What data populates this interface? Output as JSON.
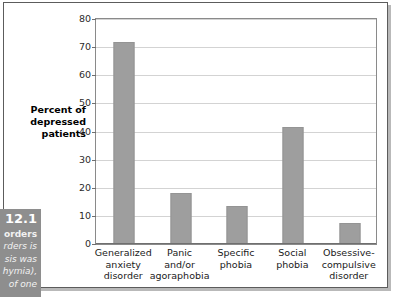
{
  "figure": {
    "caption_number": "12.1",
    "caption_lines": [
      "orders",
      "rders is",
      "sis was",
      "hymia),",
      "of one"
    ]
  },
  "colors": {
    "bar_fill": "#9e9e9e",
    "bar_stroke": "#949494",
    "gridline": "#d3d3d3",
    "plot_border": "#8a8a8a",
    "outer_frame": "#5c5c5c",
    "caption_background": "#8e8e8e",
    "plot_background": "#ffffff"
  },
  "chart_data": {
    "type": "bar",
    "title": "",
    "xlabel": "",
    "ylabel": "Percent of depressed patients",
    "ylabel_lines": [
      "Percent of",
      "depressed",
      "patients"
    ],
    "categories": [
      "Generalized anxiety disorder",
      "Panic and/or agoraphobia",
      "Specific phobia",
      "Social phobia",
      "Obsessive-compulsive disorder"
    ],
    "category_label_lines": [
      [
        "Generalized",
        "anxiety",
        "disorder"
      ],
      [
        "Panic",
        "and/or",
        "agoraphobia"
      ],
      [
        "Specific",
        "phobia"
      ],
      [
        "Social",
        "phobia"
      ],
      [
        "Obsessive-",
        "compulsive",
        "disorder"
      ]
    ],
    "values": [
      72,
      18,
      13.5,
      41.5,
      7.5
    ],
    "ylim": [
      0,
      80
    ],
    "yticks": [
      0,
      10,
      20,
      30,
      40,
      50,
      60,
      70,
      80
    ],
    "ytick_labels": [
      "0",
      "10",
      "20",
      "30",
      "40",
      "50",
      "60",
      "70",
      "80"
    ],
    "grid": true,
    "legend": false,
    "legend_position": "none"
  }
}
